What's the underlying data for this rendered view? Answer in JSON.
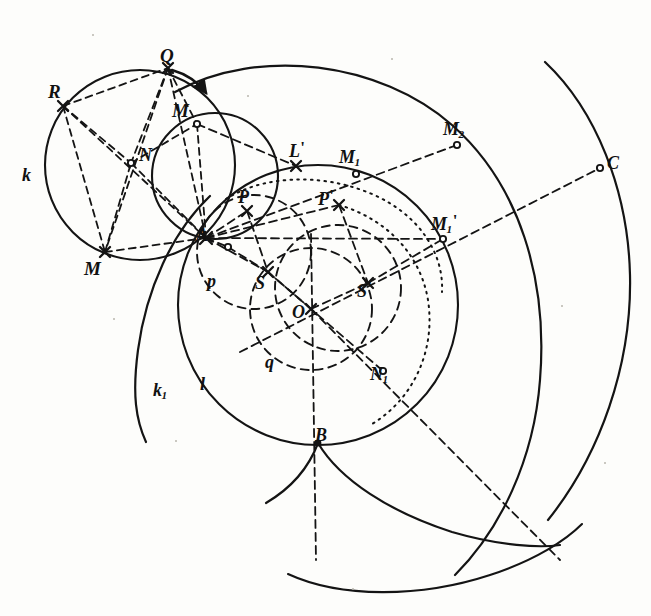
{
  "figure": {
    "kind": "line-drawing",
    "ink_color": "#141414",
    "paper_color": "#fdfdfb",
    "width": 651,
    "height": 616
  },
  "labels": [
    {
      "id": "R",
      "text": "R",
      "sub": "",
      "prime": "",
      "x": 48,
      "y": 82,
      "size": 19
    },
    {
      "id": "Q",
      "text": "Q",
      "sub": "",
      "prime": "",
      "x": 160,
      "y": 46,
      "size": 19
    },
    {
      "id": "Mtop",
      "text": "M",
      "sub": "",
      "prime": "",
      "x": 176,
      "y": 101,
      "size": 19
    },
    {
      "id": "N",
      "text": "N",
      "sub": "",
      "prime": "",
      "x": 139,
      "y": 146,
      "size": 18
    },
    {
      "id": "k",
      "text": "k",
      "sub": "",
      "prime": "",
      "x": 22,
      "y": 166,
      "size": 18
    },
    {
      "id": "M",
      "text": "M",
      "sub": "",
      "prime": "",
      "x": 84,
      "y": 259,
      "size": 19
    },
    {
      "id": "A",
      "text": "A",
      "sub": "",
      "prime": "",
      "x": 196,
      "y": 226,
      "size": 18
    },
    {
      "id": "Lp",
      "text": "L",
      "sub": "",
      "prime": "'",
      "x": 289,
      "y": 142,
      "size": 18
    },
    {
      "id": "M1",
      "text": "M",
      "sub": "1",
      "prime": "",
      "x": 339,
      "y": 148,
      "size": 18
    },
    {
      "id": "M2",
      "text": "M",
      "sub": "2",
      "prime": "",
      "x": 443,
      "y": 120,
      "size": 18
    },
    {
      "id": "C",
      "text": "C",
      "sub": "",
      "prime": "",
      "x": 607,
      "y": 154,
      "size": 18
    },
    {
      "id": "Mprime",
      "text": "M",
      "sub": "1",
      "prime": "'",
      "x": 431,
      "y": 215,
      "size": 18
    },
    {
      "id": "P",
      "text": "P",
      "sub": "",
      "prime": "",
      "x": 238,
      "y": 188,
      "size": 18
    },
    {
      "id": "Pp",
      "text": "P",
      "sub": "",
      "prime": "'",
      "x": 318,
      "y": 190,
      "size": 18
    },
    {
      "id": "p",
      "text": "p",
      "sub": "",
      "prime": "",
      "x": 207,
      "y": 272,
      "size": 18
    },
    {
      "id": "S",
      "text": "S",
      "sub": "",
      "prime": "",
      "x": 255,
      "y": 274,
      "size": 18
    },
    {
      "id": "Sp",
      "text": "S",
      "sub": "",
      "prime": "'",
      "x": 357,
      "y": 282,
      "size": 18
    },
    {
      "id": "O",
      "text": "O",
      "sub": "",
      "prime": "",
      "x": 292,
      "y": 303,
      "size": 18
    },
    {
      "id": "q",
      "text": "q",
      "sub": "",
      "prime": "",
      "x": 265,
      "y": 353,
      "size": 18
    },
    {
      "id": "N1",
      "text": "N",
      "sub": "1",
      "prime": "",
      "x": 370,
      "y": 365,
      "size": 18
    },
    {
      "id": "l",
      "text": "l",
      "sub": "",
      "prime": "",
      "x": 200,
      "y": 375,
      "size": 18
    },
    {
      "id": "k1",
      "text": "k",
      "sub": "1",
      "prime": "",
      "x": 153,
      "y": 381,
      "size": 18
    },
    {
      "id": "B",
      "text": "B",
      "sub": "",
      "prime": "",
      "x": 315,
      "y": 426,
      "size": 18
    }
  ],
  "points": [
    {
      "name": "R",
      "x": 63,
      "y": 106,
      "marker": "cross"
    },
    {
      "name": "Q",
      "x": 168,
      "y": 68,
      "marker": "cross"
    },
    {
      "name": "Mtop",
      "x": 197,
      "y": 124,
      "marker": "open"
    },
    {
      "name": "N",
      "x": 131,
      "y": 163,
      "marker": "open"
    },
    {
      "name": "M",
      "x": 105,
      "y": 252,
      "marker": "cross"
    },
    {
      "name": "A",
      "x": 206,
      "y": 238,
      "marker": "cross"
    },
    {
      "name": "Lp",
      "x": 296,
      "y": 166,
      "marker": "cross"
    },
    {
      "name": "M1",
      "x": 356,
      "y": 174,
      "marker": "open"
    },
    {
      "name": "M2",
      "x": 457,
      "y": 145,
      "marker": "open"
    },
    {
      "name": "C",
      "x": 600,
      "y": 168,
      "marker": "open"
    },
    {
      "name": "Mprime",
      "x": 443,
      "y": 239,
      "marker": "open"
    },
    {
      "name": "P",
      "x": 247,
      "y": 211,
      "marker": "cross"
    },
    {
      "name": "Pp",
      "x": 339,
      "y": 205,
      "marker": "cross"
    },
    {
      "name": "S",
      "x": 268,
      "y": 272,
      "marker": "cross"
    },
    {
      "name": "Sp",
      "x": 368,
      "y": 283,
      "marker": "cross"
    },
    {
      "name": "O",
      "x": 311,
      "y": 309,
      "marker": "cross"
    },
    {
      "name": "N1",
      "x": 383,
      "y": 371,
      "marker": "open"
    },
    {
      "name": "B",
      "x": 318,
      "y": 443,
      "marker": "dot"
    },
    {
      "name": "aux1",
      "x": 228,
      "y": 247,
      "marker": "open"
    }
  ],
  "circles": [
    {
      "name": "circle-k",
      "cx": 140,
      "cy": 165,
      "r": 95,
      "style": "solid"
    },
    {
      "name": "circle-small-AQ",
      "cx": 215,
      "cy": 175,
      "r": 63,
      "style": "solid"
    },
    {
      "name": "circle-l",
      "cx": 318,
      "cy": 305,
      "r": 140,
      "style": "solid"
    },
    {
      "name": "circle-inner-dotted",
      "cx": 311,
      "cy": 252,
      "r": 88,
      "style": "dotted"
    },
    {
      "name": "circle-q-dashed",
      "cx": 311,
      "cy": 309,
      "r": 60,
      "style": "dashed"
    },
    {
      "name": "circle-S-dashed",
      "cx": 265,
      "cy": 251,
      "r": 55,
      "style": "dashed"
    },
    {
      "name": "circle-Sp-dotted",
      "cx": 364,
      "cy": 275,
      "r": 68,
      "style": "dotted"
    },
    {
      "name": "circle-mid-dashed",
      "cx": 330,
      "cy": 285,
      "r": 58,
      "style": "dashed"
    }
  ],
  "arcs": [
    {
      "name": "arc-outer-upper",
      "note": "large arc sweeping from top-centre to right edge"
    },
    {
      "name": "arc-outer-right",
      "note": "outermost arc through C down to bottom right"
    },
    {
      "name": "arc-k1-left",
      "note": "left arc labelled k1"
    },
    {
      "name": "arc-bottom-B",
      "note": "cusp arc below B"
    }
  ],
  "chords_dashed": [
    {
      "from": "R",
      "to": "Q"
    },
    {
      "from": "R",
      "to": "M"
    },
    {
      "from": "R",
      "to": "A"
    },
    {
      "from": "R",
      "to": "N"
    },
    {
      "from": "Q",
      "to": "M"
    },
    {
      "from": "Q",
      "to": "N"
    },
    {
      "from": "Q",
      "to": "A"
    },
    {
      "from": "M",
      "to": "N"
    },
    {
      "from": "M",
      "to": "A"
    },
    {
      "from": "N",
      "to": "Mtop"
    },
    {
      "from": "Mtop",
      "to": "A"
    },
    {
      "from": "Mtop",
      "to": "Lp"
    },
    {
      "from": "A",
      "to": "M2"
    },
    {
      "from": "A",
      "to": "Mprime"
    },
    {
      "from": "A",
      "to": "P"
    },
    {
      "from": "A",
      "to": "Pp"
    },
    {
      "from": "A",
      "to": "S"
    },
    {
      "from": "A",
      "to": "B"
    },
    {
      "from": "O",
      "to": "S"
    },
    {
      "from": "O",
      "to": "Sp"
    },
    {
      "from": "O",
      "to": "C"
    },
    {
      "from": "O",
      "to": "B"
    },
    {
      "from": "S",
      "to": "P"
    },
    {
      "from": "Sp",
      "to": "Pp"
    },
    {
      "from": "Sp",
      "to": "Mprime"
    },
    {
      "from": "S",
      "to": "N1"
    }
  ],
  "annotations": {
    "arrow_at_Q": "short curved arrow from Q toward M",
    "dash_vertical_OB": "vertical dashed axis from O down through B"
  }
}
